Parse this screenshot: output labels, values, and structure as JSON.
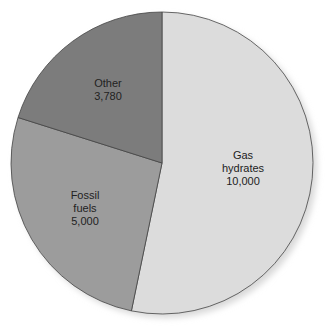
{
  "chart_data": {
    "type": "pie",
    "title": "",
    "categories": [
      "Gas hydrates",
      "Fossil fuels",
      "Other"
    ],
    "values": [
      10000,
      5000,
      3780
    ],
    "labels": [
      {
        "lines": [
          "Gas",
          "hydrates",
          "10,000"
        ]
      },
      {
        "lines": [
          "Fossil",
          "fuels",
          "5,000"
        ]
      },
      {
        "lines": [
          "Other",
          "3,780"
        ]
      }
    ],
    "colors": [
      "#dcdcdc",
      "#9c9c9c",
      "#7c7c7c"
    ]
  }
}
